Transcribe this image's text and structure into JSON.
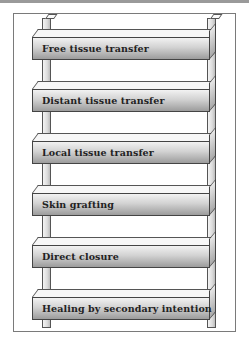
{
  "diagram": {
    "type": "ladder",
    "rungs": [
      {
        "label": "Free tissue transfer",
        "level": 6
      },
      {
        "label": "Distant tissue transfer",
        "level": 5
      },
      {
        "label": "Local tissue transfer",
        "level": 4
      },
      {
        "label": "Skin grafting",
        "level": 3
      },
      {
        "label": "Direct closure",
        "level": 2
      },
      {
        "label": "Healing by secondary intention",
        "level": 1
      }
    ]
  },
  "colors": {
    "frame_border": "#7a7a7a",
    "rung_light": "#f2f2f2",
    "rung_dark": "#9c9c9c",
    "text": "#222222"
  }
}
